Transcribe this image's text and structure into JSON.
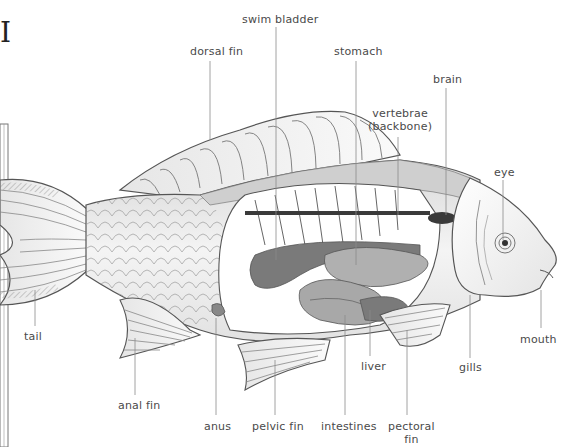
{
  "diagram": {
    "title_fragment": "I",
    "labels": [
      {
        "id": "swim-bladder",
        "text": "swim bladder",
        "x": 242,
        "y": 13
      },
      {
        "id": "dorsal-fin",
        "text": "dorsal fin",
        "x": 190,
        "y": 45
      },
      {
        "id": "stomach",
        "text": "stomach",
        "x": 334,
        "y": 45
      },
      {
        "id": "brain",
        "text": "brain",
        "x": 433,
        "y": 73
      },
      {
        "id": "vertebrae",
        "text": "vertebrae\n(backbone)",
        "x": 368,
        "y": 107
      },
      {
        "id": "eye",
        "text": "eye",
        "x": 494,
        "y": 166
      },
      {
        "id": "tail",
        "text": "tail",
        "x": 24,
        "y": 330
      },
      {
        "id": "mouth",
        "text": "mouth",
        "x": 520,
        "y": 333
      },
      {
        "id": "liver",
        "text": "liver",
        "x": 361,
        "y": 360
      },
      {
        "id": "gills",
        "text": "gills",
        "x": 459,
        "y": 361
      },
      {
        "id": "anal-fin",
        "text": "anal fin",
        "x": 118,
        "y": 399
      },
      {
        "id": "anus",
        "text": "anus",
        "x": 204,
        "y": 420
      },
      {
        "id": "pelvic-fin",
        "text": "pelvic fin",
        "x": 252,
        "y": 420
      },
      {
        "id": "intestines",
        "text": "intestines",
        "x": 321,
        "y": 420
      },
      {
        "id": "pectoral-fin",
        "text": "pectoral\nfin",
        "x": 388,
        "y": 420
      }
    ]
  },
  "colors": {
    "label_text": "#4a4a4a",
    "leader_line": "#8a8a8a",
    "outline": "#555555",
    "body_fill": "#f0f0f0",
    "organ_dark": "#7a7a7a",
    "organ_mid": "#a8a8a8",
    "organ_light": "#c8c8c8",
    "dark_band": "#3a3a3a"
  }
}
